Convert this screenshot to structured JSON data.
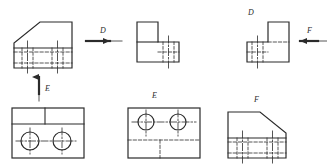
{
  "drawing": {
    "title": "Orthographic projection exercise",
    "line_color": "#2b2b2b",
    "hidden_line_color": "#4a4a4a",
    "center_line_color": "#555555",
    "background": "#ffffff",
    "labels": {
      "arrow_d": "D",
      "arrow_e": "E",
      "arrow_f": "F",
      "view_d": "D",
      "view_e": "E",
      "view_f": "F"
    },
    "views": [
      {
        "name": "front-view",
        "position": "top-left",
        "shape": "chamfered-block",
        "outline": "15,20 50,20 50,16 ... trapezoid with upper-left chamfer",
        "features": "lower band with four hidden vertical lines and two center lines"
      },
      {
        "name": "side-view-d",
        "position": "top-center",
        "shape": "L-block",
        "features": "vertical leg upper-left, horizontal foot lower-right with hidden lines"
      },
      {
        "name": "side-view-f",
        "position": "top-right",
        "shape": "mirrored-L-block",
        "features": "vertical leg upper-right, horizontal foot lower-left with hidden lines"
      },
      {
        "name": "top-view-e",
        "position": "bottom-left",
        "shape": "rectangle-two-holes",
        "features": "upper band split by vertical divider, two circles with cross center lines"
      },
      {
        "name": "view-e",
        "position": "bottom-center",
        "shape": "rectangle-two-holes-hidden",
        "features": "two circles with center lines, hidden step lines in lower half"
      },
      {
        "name": "view-f",
        "position": "bottom-right",
        "shape": "mirrored-chamfered-block",
        "features": "trapezoid with upper-right chamfer, hidden vertical lines and center lines"
      }
    ],
    "arrows": [
      {
        "name": "arrow-d",
        "direction": "right",
        "label": "D"
      },
      {
        "name": "arrow-e",
        "direction": "up",
        "label": "E"
      },
      {
        "name": "arrow-f",
        "direction": "left",
        "label": "F"
      }
    ]
  }
}
